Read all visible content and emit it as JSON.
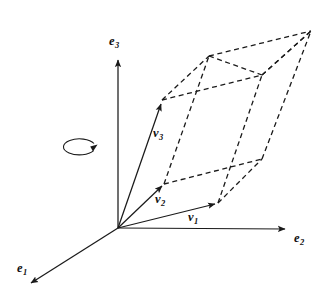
{
  "figure": {
    "width": 329,
    "height": 302,
    "background": "#ffffff",
    "stroke_color": "#1a1a1a"
  },
  "labels": {
    "e1": {
      "base": "e",
      "sub": "1"
    },
    "e2": {
      "base": "e",
      "sub": "2"
    },
    "e3": {
      "base": "e",
      "sub": "3"
    },
    "v1": {
      "base": "v",
      "sub": "1"
    },
    "v2": {
      "base": "v",
      "sub": "2"
    },
    "v3": {
      "base": "v",
      "sub": "3"
    }
  },
  "geometry": {
    "origin": {
      "x": 118,
      "y": 228
    },
    "axes": [
      {
        "name": "e1",
        "tip": {
          "x": 28,
          "y": 285
        },
        "style": "solid-arrow"
      },
      {
        "name": "e2",
        "tip": {
          "x": 288,
          "y": 229
        },
        "style": "solid-arrow"
      },
      {
        "name": "e3",
        "tip": {
          "x": 118,
          "y": 57
        },
        "style": "solid-arrow"
      }
    ],
    "vectors": [
      {
        "name": "v1",
        "tip": {
          "x": 218,
          "y": 203
        },
        "style": "solid-arrow"
      },
      {
        "name": "v2",
        "tip": {
          "x": 164,
          "y": 184
        },
        "style": "solid-arrow"
      },
      {
        "name": "v3",
        "tip": {
          "x": 162,
          "y": 100
        },
        "style": "solid-arrow"
      }
    ],
    "parallelepiped_vertices": {
      "o": {
        "x": 118,
        "y": 228
      },
      "v1": {
        "x": 218,
        "y": 203
      },
      "v2": {
        "x": 164,
        "y": 184
      },
      "v3": {
        "x": 162,
        "y": 100
      },
      "v1v2": {
        "x": 262,
        "y": 159
      },
      "v1v3": {
        "x": 262,
        "y": 75
      },
      "v2v3": {
        "x": 209,
        "y": 56
      },
      "v1v2v3": {
        "x": 311,
        "y": 31
      }
    },
    "rotation_indicator": {
      "center": {
        "x": 80,
        "y": 147
      },
      "rx": 16,
      "ry": 8,
      "direction": "counter-clockwise-about-e3"
    }
  },
  "label_positions": {
    "e1": {
      "x": 17,
      "y": 262
    },
    "e2": {
      "x": 294,
      "y": 232
    },
    "e3": {
      "x": 109,
      "y": 35
    },
    "v1": {
      "x": 188,
      "y": 211
    },
    "v2": {
      "x": 155,
      "y": 193
    },
    "v3": {
      "x": 153,
      "y": 127
    }
  }
}
